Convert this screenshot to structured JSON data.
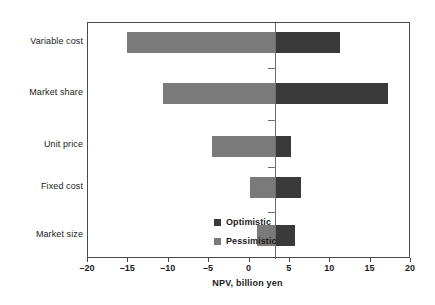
{
  "chart_data": {
    "type": "bar",
    "variant": "tornado",
    "title": "",
    "xlabel": "NPV, billion yen",
    "ylabel": "",
    "xlim": [
      -20,
      20
    ],
    "xticks": [
      -20,
      -15,
      -10,
      -5,
      0,
      5,
      10,
      15,
      20
    ],
    "xticklabels": [
      "–20",
      "–15",
      "–10",
      "–5",
      "0",
      "5",
      "10",
      "15",
      "20"
    ],
    "grid": false,
    "base_value": 3.2,
    "categories": [
      "Variable cost",
      "Market share",
      "Unit price",
      "Fixed cost",
      "Market size"
    ],
    "series": [
      {
        "name": "Pessimistic",
        "color": "#7a7a7a",
        "values": [
          -15.2,
          -10.7,
          -4.6,
          0.1,
          0.9
        ]
      },
      {
        "name": "Optimistic",
        "color": "#3a3a3a",
        "values": [
          11.2,
          17.2,
          5.1,
          6.4,
          5.6
        ]
      }
    ],
    "legend": {
      "position": "inside-lower-left",
      "entries": [
        {
          "label": "Optimistic",
          "color": "#3a3a3a"
        },
        {
          "label": "Pessimistic",
          "color": "#7a7a7a"
        }
      ]
    },
    "colors": {
      "optimistic": "#3a3a3a",
      "pessimistic": "#7a7a7a",
      "axis": "#4a4a4a",
      "baseline": "#6d6d6d",
      "text": "#1a1a1a",
      "background": "#ffffff"
    }
  }
}
